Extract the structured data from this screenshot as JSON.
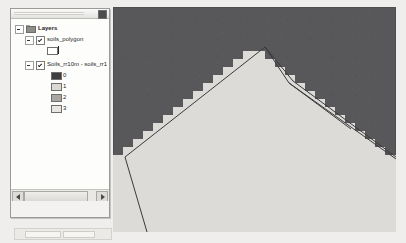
{
  "window": {
    "background_color": "#efeeec"
  },
  "toc_panel": {
    "name": "Table of Contents",
    "close_button_label": "",
    "root": {
      "label": "Layers",
      "icon": "folder-icon",
      "expander": "collapse-box"
    },
    "layers": [
      {
        "label": "soils_polygon",
        "checked": true,
        "symbols": [
          {
            "label": "",
            "fill": "#ffffff",
            "outline": "#6e6e6c",
            "type": "hollow-polygon"
          }
        ]
      },
      {
        "label": "Soils_rr10m - soils_rr1",
        "checked": true,
        "symbols": [
          {
            "label": "0",
            "fill": "#3f3f41",
            "outline": "#6e6e6c",
            "type": "raster-class"
          },
          {
            "label": "1",
            "fill": "#d9d8d4",
            "outline": "#6e6e6c",
            "type": "raster-class"
          },
          {
            "label": "2",
            "fill": "#a8a7a4",
            "outline": "#6e6e6c",
            "type": "raster-class"
          },
          {
            "label": "3",
            "fill": "#e8e7e3",
            "outline": "#6e6e6c",
            "type": "raster-class"
          }
        ]
      }
    ],
    "scrollbar": {
      "left_arrow": "◀",
      "right_arrow": "▶"
    }
  },
  "map_view": {
    "name": "map-data-frame",
    "background_color": "#58585a",
    "raster_fill": "#dcdbd7",
    "vector_line_color": "#3a3a3c",
    "description": "Stepped raster polygon boundary overlaid with smooth vector polygon outlines"
  }
}
